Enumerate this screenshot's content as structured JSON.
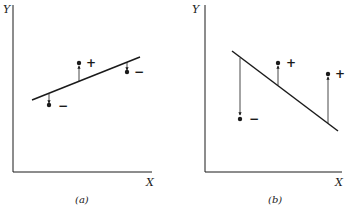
{
  "panels": [
    {
      "id": "a",
      "caption": "(a)",
      "y_label": "Y",
      "x_label": "X",
      "line_slope": "positive",
      "points": [
        {
          "sign": "−",
          "position": "below line"
        },
        {
          "sign": "+",
          "position": "above line"
        },
        {
          "sign": "−",
          "position": "below line"
        }
      ]
    },
    {
      "id": "b",
      "caption": "(b)",
      "y_label": "Y",
      "x_label": "X",
      "line_slope": "negative",
      "points": [
        {
          "sign": "−",
          "position": "below line"
        },
        {
          "sign": "+",
          "position": "above line"
        },
        {
          "sign": "+",
          "position": "above line"
        }
      ]
    }
  ],
  "colors": {
    "ink": "#1a1a1a",
    "background": "#ffffff"
  }
}
